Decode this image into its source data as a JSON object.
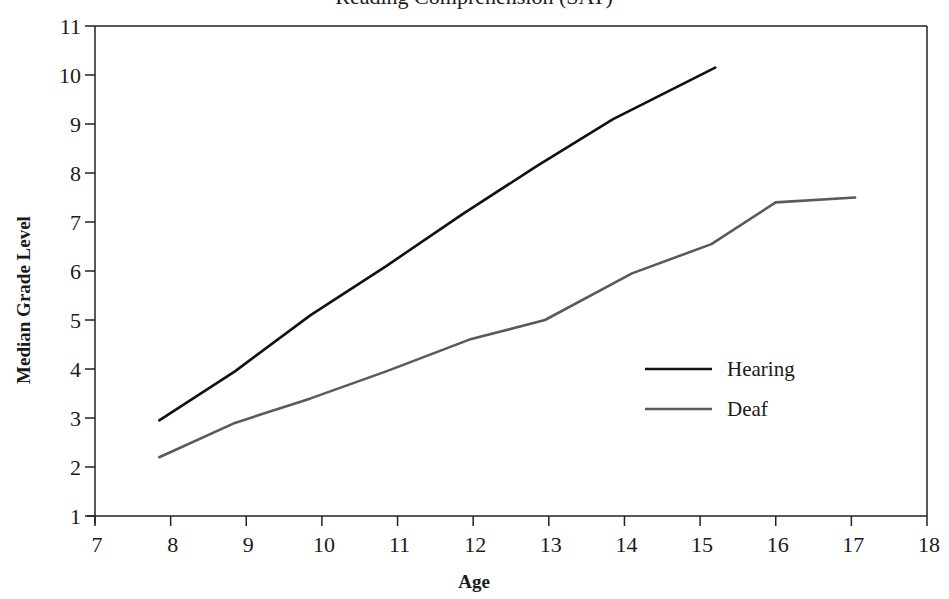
{
  "chart_data": {
    "type": "line",
    "title": "Reading Comprehension (SAT)",
    "xlabel": "Age",
    "ylabel": "Median Grade Level",
    "xlim": [
      7,
      18
    ],
    "ylim": [
      1,
      11
    ],
    "x_ticks": [
      7,
      8,
      9,
      10,
      11,
      12,
      13,
      14,
      15,
      16,
      17,
      18
    ],
    "y_ticks": [
      1,
      2,
      3,
      4,
      5,
      6,
      7,
      8,
      9,
      10,
      11
    ],
    "grid": false,
    "legend_position": "lower right (inside)",
    "series": [
      {
        "name": "Hearing",
        "color": "#111111",
        "x": [
          7.85,
          8.85,
          9.85,
          10.85,
          11.85,
          12.85,
          13.85,
          15.2
        ],
        "values": [
          2.95,
          3.95,
          5.1,
          6.1,
          7.15,
          8.15,
          9.1,
          10.15
        ]
      },
      {
        "name": "Deaf",
        "color": "#5a5a5a",
        "x": [
          7.85,
          8.85,
          9.85,
          10.85,
          11.95,
          12.95,
          14.1,
          15.15,
          16.0,
          17.05
        ],
        "values": [
          2.2,
          2.9,
          3.4,
          3.95,
          4.6,
          5.0,
          5.95,
          6.55,
          7.4,
          7.5
        ]
      }
    ]
  },
  "legend": {
    "items": [
      {
        "label": "Hearing",
        "color": "#111111"
      },
      {
        "label": "Deaf",
        "color": "#5a5a5a"
      }
    ]
  },
  "axes": {
    "x_title": "Age",
    "y_title": "Median Grade Level"
  }
}
